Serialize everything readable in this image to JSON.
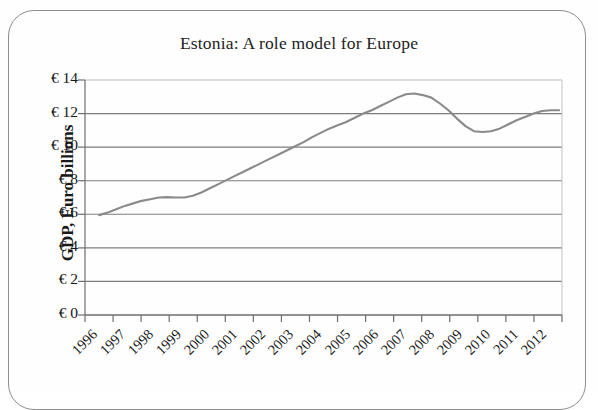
{
  "chart_data": {
    "type": "line",
    "title": "Estonia: A role model for Europe",
    "xlabel": "",
    "ylabel": "GDP, Euro billions",
    "grid": true,
    "legend": false,
    "ylim": [
      0,
      14
    ],
    "xlim": [
      1996,
      2012.8
    ],
    "y_tick_labels": [
      "€ 14",
      "€ 12",
      "€ 10",
      "€ 8",
      "€ 6",
      "€ 4",
      "€ 2",
      "€ 0"
    ],
    "y_tick_values": [
      14,
      12,
      10,
      8,
      6,
      4,
      2,
      0
    ],
    "x_tick_labels": [
      "1996",
      "1997",
      "1998",
      "1999",
      "2000",
      "2001",
      "2002",
      "2003",
      "2004",
      "2005",
      "2006",
      "2007",
      "2008",
      "2009",
      "2010",
      "2011",
      "2012"
    ],
    "series": [
      {
        "name": "GDP, Euro billions",
        "color": "#8a8a8a",
        "x": [
          1996.5,
          1996.8,
          1997.1,
          1997.4,
          1997.7,
          1998.0,
          1998.3,
          1998.6,
          1998.9,
          1999.2,
          1999.5,
          1999.8,
          2000.1,
          2000.4,
          2000.7,
          2001.0,
          2001.3,
          2001.6,
          2001.9,
          2002.2,
          2002.5,
          2002.8,
          2003.1,
          2003.4,
          2003.7,
          2004.0,
          2004.3,
          2004.6,
          2004.9,
          2005.2,
          2005.5,
          2005.8,
          2006.1,
          2006.4,
          2006.7,
          2007.0,
          2007.3,
          2007.6,
          2007.9,
          2008.2,
          2008.5,
          2008.8,
          2009.1,
          2009.4,
          2009.7,
          2010.0,
          2010.3,
          2010.6,
          2010.9,
          2011.2,
          2011.5,
          2011.8,
          2012.1,
          2012.4,
          2012.7
        ],
        "y": [
          5.95,
          6.1,
          6.3,
          6.5,
          6.65,
          6.8,
          6.9,
          7.0,
          7.02,
          7.0,
          7.0,
          7.1,
          7.3,
          7.55,
          7.8,
          8.05,
          8.3,
          8.55,
          8.8,
          9.05,
          9.3,
          9.55,
          9.8,
          10.05,
          10.3,
          10.6,
          10.85,
          11.1,
          11.3,
          11.5,
          11.75,
          12.0,
          12.2,
          12.45,
          12.7,
          12.95,
          13.15,
          13.2,
          13.1,
          12.95,
          12.6,
          12.2,
          11.7,
          11.25,
          10.95,
          10.9,
          10.95,
          11.1,
          11.35,
          11.6,
          11.8,
          12.0,
          12.15,
          12.2,
          12.2
        ],
        "key_points": {
          "start_1996": 5.95,
          "plateau_1998_1999": 7.0,
          "crossing_10_2003": 10.0,
          "peak_2007": 13.2,
          "trough_2010": 10.9,
          "end_2012": 12.2
        }
      }
    ]
  },
  "frame": {
    "border_color": "#8e8e8e"
  }
}
